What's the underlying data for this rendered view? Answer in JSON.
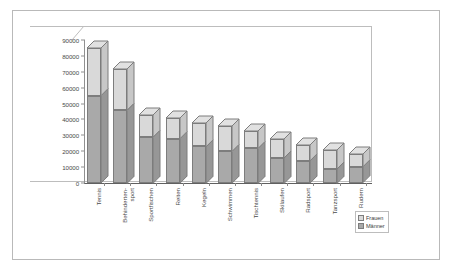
{
  "chart_data": {
    "type": "bar",
    "subtype": "stacked-3d-column",
    "title": "",
    "xlabel": "",
    "ylabel": "",
    "ylim": [
      0,
      90000
    ],
    "ytick_step": 10000,
    "yticks": [
      "0",
      "10000",
      "20000",
      "30000",
      "40000",
      "50000",
      "60000",
      "70000",
      "80000",
      "90000"
    ],
    "grid": false,
    "legend_position": "bottom-right",
    "categories": [
      "Tennis",
      "Behinderten-sport",
      "Sportfischen",
      "Reiten",
      "Kegeln",
      "Schwimmen",
      "Tischtennis",
      "Skilaufen",
      "Radsport",
      "Tanzsport",
      "Rudern"
    ],
    "series": [
      {
        "name": "Männer",
        "color": "#a9a9a9",
        "values": [
          55000,
          46000,
          29000,
          28000,
          23000,
          20000,
          22000,
          16000,
          14000,
          9000,
          10000
        ]
      },
      {
        "name": "Frauen",
        "color": "#d9d9d9",
        "values": [
          30000,
          26000,
          14000,
          13000,
          15000,
          16000,
          11000,
          12000,
          10000,
          12000,
          8000
        ]
      }
    ],
    "totals": [
      85000,
      72000,
      43000,
      41000,
      38000,
      36000,
      33000,
      28000,
      24000,
      21000,
      18000
    ]
  },
  "legend": {
    "items": [
      {
        "label": "Frauen",
        "color": "#d9d9d9"
      },
      {
        "label": "Männer",
        "color": "#a9a9a9"
      }
    ]
  },
  "colors": {
    "men": "#a9a9a9",
    "women": "#d9d9d9",
    "bar_border": "#7d7d7d",
    "axis": "#909090",
    "frame": "#bdbdbd",
    "page_border": "#b9b9b9",
    "text": "#4a4a4a",
    "background": "#ffffff"
  }
}
